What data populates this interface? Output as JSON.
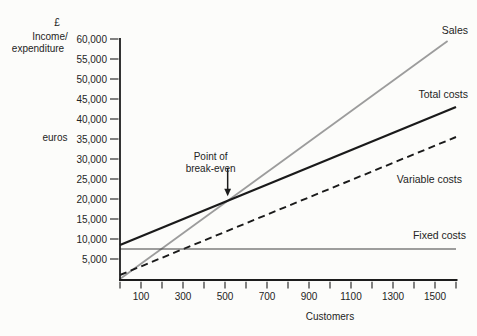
{
  "figure": {
    "y_axis_title_lines": [
      "£",
      "Income/",
      "expenditure"
    ],
    "y_axis_unit_label": "euros"
  },
  "colors": {
    "background": "#fcfcfa",
    "axis_ink": "#1c1c1c",
    "text_ink": "#242424",
    "sales_line": "#9c9c9c",
    "cost_line": "#1a1a1a",
    "fixed_line": "#3f3f3f"
  },
  "chart_data": {
    "type": "line",
    "x_axis": {
      "label": "Customers",
      "min": 0,
      "max": 1600,
      "tick_step": 100,
      "labeled_ticks": [
        {
          "value": 100,
          "label": "100"
        },
        {
          "value": 300,
          "label": "300"
        },
        {
          "value": 500,
          "label": "500"
        },
        {
          "value": 700,
          "label": "700"
        },
        {
          "value": 900,
          "label": "900"
        },
        {
          "value": 1100,
          "label": "1100"
        },
        {
          "value": 1300,
          "label": "1300"
        },
        {
          "value": 1500,
          "label": "1500"
        }
      ]
    },
    "y_axis": {
      "label": "£ Income/expenditure (euros)",
      "min": 0,
      "max": 60000,
      "tick_step": 5000,
      "labeled_ticks": [
        {
          "value": 60000,
          "label": "60,000"
        },
        {
          "value": 55000,
          "label": "55,000"
        },
        {
          "value": 50000,
          "label": "50,000"
        },
        {
          "value": 45000,
          "label": "45,000"
        },
        {
          "value": 40000,
          "label": "40,000"
        },
        {
          "value": 35000,
          "label": "35,000"
        },
        {
          "value": 30000,
          "label": "30,000"
        },
        {
          "value": 25000,
          "label": "25,000"
        },
        {
          "value": 20000,
          "label": "20,000"
        },
        {
          "value": 15000,
          "label": "15,000"
        },
        {
          "value": 10000,
          "label": "10,000"
        },
        {
          "value": 5000,
          "label": "5,000"
        }
      ]
    },
    "series": [
      {
        "name": "Sales",
        "label": "Sales",
        "points": [
          [
            0,
            0
          ],
          [
            1560,
            59500
          ]
        ],
        "color_key": "sales_line",
        "width": 1.8,
        "dash": "",
        "label_anchor_px": [
          468,
          34
        ]
      },
      {
        "name": "Total costs",
        "label": "Total costs",
        "points": [
          [
            0,
            8500
          ],
          [
            1600,
            43000
          ]
        ],
        "color_key": "cost_line",
        "width": 2.2,
        "dash": "",
        "label_anchor_px": [
          468,
          98
        ]
      },
      {
        "name": "Variable costs",
        "label": "Variable costs",
        "points": [
          [
            0,
            1000
          ],
          [
            1600,
            35500
          ]
        ],
        "color_key": "cost_line",
        "width": 1.9,
        "dash": "7 4.5",
        "label_anchor_px": [
          462,
          183
        ]
      },
      {
        "name": "Fixed costs",
        "label": "Fixed costs",
        "points": [
          [
            0,
            7500
          ],
          [
            1600,
            7500
          ]
        ],
        "color_key": "fixed_line",
        "width": 1.2,
        "dash": "",
        "label_anchor_px": [
          466,
          239
        ]
      }
    ],
    "annotation": {
      "lines": [
        "Point of",
        "break-even"
      ],
      "between_series": [
        "Sales",
        "Total costs"
      ],
      "break_even_approx": {
        "customers": 500,
        "value": 19500
      }
    },
    "layout_hints": {
      "grid": false,
      "legend_position": "inline-right-of-lines",
      "xlim": [
        0,
        1600
      ],
      "ylim": [
        0,
        60000
      ]
    }
  }
}
